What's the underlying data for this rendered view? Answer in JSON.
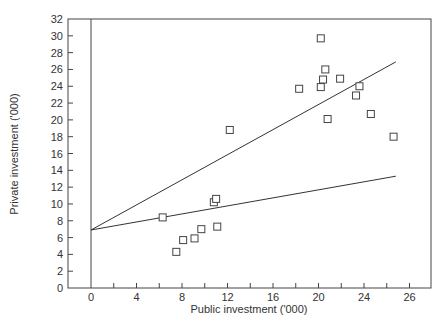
{
  "chart_data": {
    "type": "scatter",
    "title": "",
    "xlabel": "Public investment ('000)",
    "ylabel": "Private investment ('000)",
    "xlim": [
      -2,
      30
    ],
    "ylim": [
      0,
      32
    ],
    "grid": false,
    "legend": null,
    "x_ticks": [
      {
        "value": 0,
        "label": "0"
      },
      {
        "value": 2,
        "label": ""
      },
      {
        "value": 4,
        "label": "4"
      },
      {
        "value": 6,
        "label": ""
      },
      {
        "value": 8,
        "label": "8"
      },
      {
        "value": 10,
        "label": ""
      },
      {
        "value": 12,
        "label": "12"
      },
      {
        "value": 14,
        "label": ""
      },
      {
        "value": 16,
        "label": "16"
      },
      {
        "value": 18,
        "label": ""
      },
      {
        "value": 20,
        "label": "20"
      },
      {
        "value": 22,
        "label": ""
      },
      {
        "value": 24,
        "label": "24"
      },
      {
        "value": 26,
        "label": ""
      },
      {
        "value": 28,
        "label": "26"
      }
    ],
    "y_ticks": [
      0,
      2,
      4,
      6,
      8,
      10,
      12,
      14,
      16,
      18,
      20,
      22,
      24,
      26,
      28,
      30,
      32
    ],
    "series": [
      {
        "name": "Observations",
        "marker": "open-square",
        "points": [
          {
            "x": 6.3,
            "y": 8.4
          },
          {
            "x": 7.5,
            "y": 4.3
          },
          {
            "x": 8.1,
            "y": 5.7
          },
          {
            "x": 9.1,
            "y": 5.9
          },
          {
            "x": 9.7,
            "y": 7.0
          },
          {
            "x": 11.1,
            "y": 7.3
          },
          {
            "x": 10.8,
            "y": 10.2
          },
          {
            "x": 11.0,
            "y": 10.6
          },
          {
            "x": 12.2,
            "y": 18.8
          },
          {
            "x": 18.3,
            "y": 23.7
          },
          {
            "x": 20.2,
            "y": 23.9
          },
          {
            "x": 20.4,
            "y": 24.8
          },
          {
            "x": 20.2,
            "y": 29.7
          },
          {
            "x": 20.6,
            "y": 26.0
          },
          {
            "x": 20.8,
            "y": 20.1
          },
          {
            "x": 21.9,
            "y": 24.9
          },
          {
            "x": 23.3,
            "y": 22.9
          },
          {
            "x": 23.6,
            "y": 24.0
          },
          {
            "x": 24.6,
            "y": 20.7
          },
          {
            "x": 26.6,
            "y": 18.0
          }
        ]
      },
      {
        "name": "Upper fitted line",
        "type": "line",
        "points": [
          {
            "x": 0,
            "y": 6.9
          },
          {
            "x": 26.8,
            "y": 26.9
          }
        ]
      },
      {
        "name": "Lower fitted line",
        "type": "line",
        "points": [
          {
            "x": 0,
            "y": 6.9
          },
          {
            "x": 26.8,
            "y": 13.3
          }
        ]
      }
    ],
    "annotations": [
      "Vertical reference line at x = 0"
    ]
  }
}
